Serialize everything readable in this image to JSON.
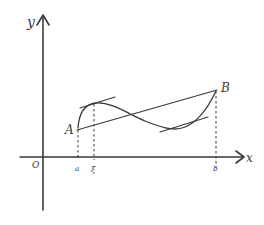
{
  "diagram": {
    "type": "mean-value-theorem-sketch",
    "labels": {
      "y_axis": "y",
      "x_axis": "x",
      "origin": "O",
      "point_a": "A",
      "point_b": "B",
      "tick_a": "a",
      "tick_xi": "ξ",
      "tick_b": "b"
    },
    "elements": [
      {
        "id": "y-axis",
        "kind": "arrow-axis"
      },
      {
        "id": "x-axis",
        "kind": "arrow-axis"
      },
      {
        "id": "curve",
        "kind": "curve",
        "from": "A",
        "to": "B"
      },
      {
        "id": "secant-AB",
        "kind": "line",
        "from": "A",
        "to": "B"
      },
      {
        "id": "tangent-at-xi",
        "kind": "tangent-line",
        "parallel_to": "secant-AB"
      },
      {
        "id": "tangent-at-trough",
        "kind": "tangent-line",
        "parallel_to": "secant-AB"
      },
      {
        "id": "drop-a",
        "kind": "dashed-line",
        "to_tick": "a"
      },
      {
        "id": "drop-xi",
        "kind": "dashed-line",
        "to_tick": "ξ"
      },
      {
        "id": "drop-b",
        "kind": "dashed-line",
        "to_tick": "b"
      }
    ],
    "stroke_color": "#3a3a3a",
    "background": "#ffffff"
  }
}
